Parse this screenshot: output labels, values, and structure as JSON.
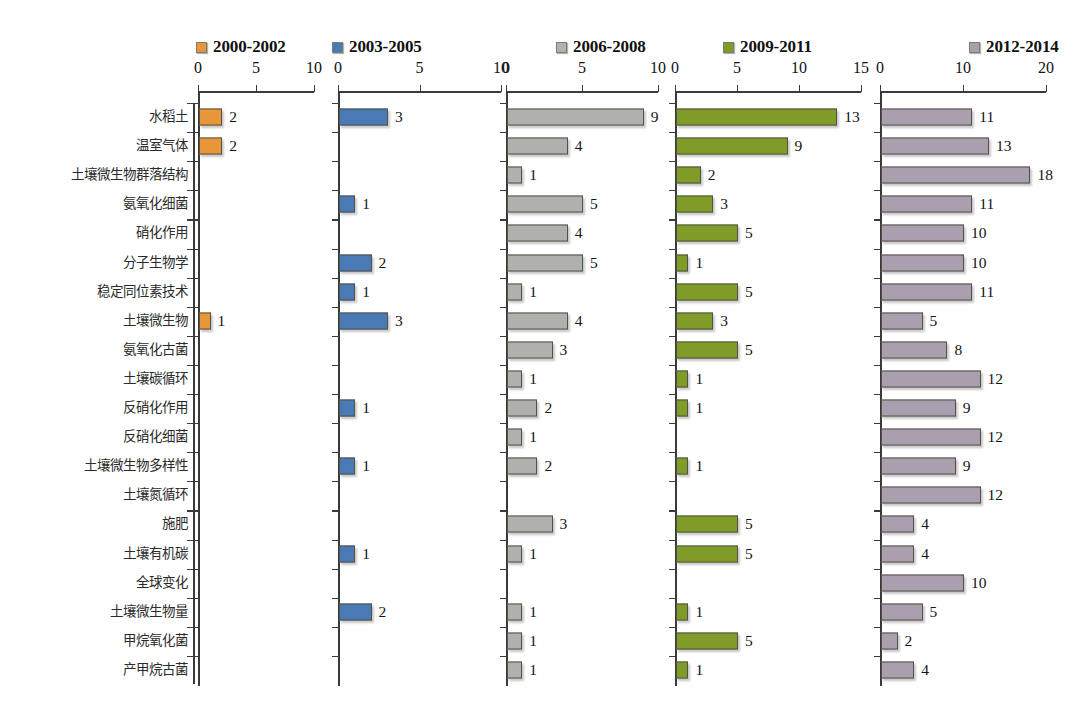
{
  "chart_data": {
    "type": "bar",
    "title": "",
    "xlabel": "",
    "ylabel": "",
    "orientation": "horizontal",
    "grid": false,
    "legend_position": "top",
    "layout": "small-multiples-5-panels",
    "categories": [
      "水稻土",
      "温室气体",
      "土壤微生物群落结构",
      "氨氧化细菌",
      "硝化作用",
      "分子生物学",
      "稳定同位素技术",
      "土壤微生物",
      "氨氧化古菌",
      "土壤碳循环",
      "反硝化作用",
      "反硝化细菌",
      "土壤微生物多样性",
      "土壤氮循环",
      "施肥",
      "土壤有机碳",
      "全球变化",
      "土壤微生物量",
      "甲烷氧化菌",
      "产甲烷古菌"
    ],
    "series": [
      {
        "name": "2000-2002",
        "color": "#e8963a",
        "xlim": [
          0,
          10
        ],
        "xticks": [
          0,
          5,
          10
        ],
        "values": [
          2,
          2,
          0,
          0,
          0,
          0,
          0,
          1,
          0,
          0,
          0,
          0,
          0,
          0,
          0,
          0,
          0,
          0,
          0,
          0
        ]
      },
      {
        "name": "2003-2005",
        "color": "#4a7ab5",
        "xlim": [
          0,
          10
        ],
        "xticks": [
          0,
          5,
          10
        ],
        "values": [
          3,
          0,
          0,
          1,
          0,
          2,
          1,
          3,
          0,
          0,
          1,
          0,
          1,
          0,
          0,
          1,
          0,
          2,
          0,
          0
        ]
      },
      {
        "name": "2006-2008",
        "color": "#b0b0ad",
        "xlim": [
          0,
          10
        ],
        "xticks": [
          0,
          5,
          10
        ],
        "values": [
          9,
          4,
          1,
          5,
          4,
          5,
          1,
          4,
          3,
          1,
          2,
          1,
          2,
          0,
          3,
          1,
          0,
          1,
          1,
          1
        ]
      },
      {
        "name": "2009-2011",
        "color": "#7f9c28",
        "xlim": [
          0,
          15
        ],
        "xticks": [
          0,
          5,
          10,
          15
        ],
        "values": [
          13,
          9,
          2,
          3,
          5,
          1,
          5,
          3,
          5,
          1,
          1,
          0,
          1,
          0,
          5,
          5,
          0,
          1,
          5,
          1
        ]
      },
      {
        "name": "2012-2014",
        "color": "#a99fae",
        "xlim": [
          0,
          20
        ],
        "xticks": [
          0,
          10,
          20
        ],
        "values": [
          11,
          13,
          18,
          11,
          10,
          10,
          11,
          5,
          8,
          12,
          9,
          12,
          9,
          12,
          4,
          4,
          10,
          5,
          2,
          4
        ]
      }
    ]
  }
}
